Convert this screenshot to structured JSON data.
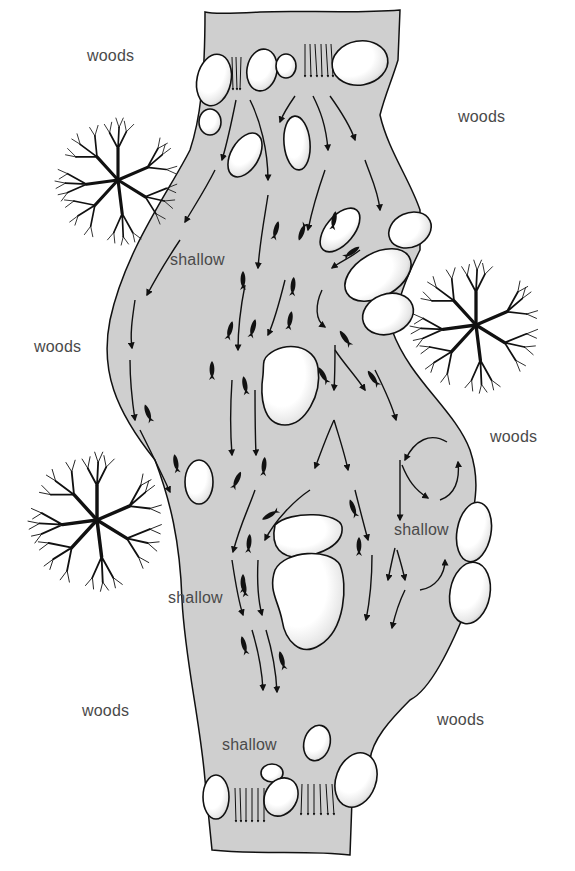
{
  "diagram": {
    "type": "stream habitat illustration",
    "colors": {
      "water": "#cfcfcf",
      "outline": "#111111",
      "rock_fill": "#ffffff",
      "label_text": "#4a4a4a"
    },
    "labels": [
      {
        "id": "woods-top-left",
        "text": "woods",
        "x": 87,
        "y": 65
      },
      {
        "id": "woods-top-right",
        "text": "woods",
        "x": 458,
        "y": 125
      },
      {
        "id": "woods-mid-left",
        "text": "woods",
        "x": 34,
        "y": 355
      },
      {
        "id": "woods-mid-right",
        "text": "woods",
        "x": 490,
        "y": 445
      },
      {
        "id": "woods-bottom-left",
        "text": "woods",
        "x": 82,
        "y": 720
      },
      {
        "id": "woods-bottom-right",
        "text": "woods",
        "x": 437,
        "y": 728
      },
      {
        "id": "shallow-upper",
        "text": "shallow",
        "x": 170,
        "y": 268
      },
      {
        "id": "shallow-right",
        "text": "shallow",
        "x": 395,
        "y": 538
      },
      {
        "id": "shallow-left",
        "text": "shallow",
        "x": 168,
        "y": 606
      },
      {
        "id": "shallow-bottom",
        "text": "shallow",
        "x": 222,
        "y": 753
      }
    ],
    "features": {
      "trees": 3,
      "rocks": 22,
      "fish": 26,
      "current_arrows": "many, flowing downstream"
    }
  }
}
